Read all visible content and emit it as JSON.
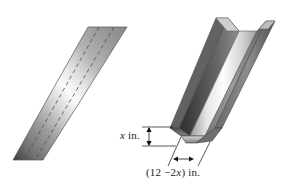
{
  "figure": {
    "objects": {
      "flat_sheet": {
        "name": "flat-metal-sheet",
        "fold_lines": 2,
        "fold_line_style": "dashed"
      },
      "folded_gutter": {
        "name": "folded-u-channel-gutter",
        "faces": [
          "left-wall",
          "bottom",
          "right-wall"
        ]
      }
    },
    "labels": {
      "height_label": "x in.",
      "height_label_variable": "x",
      "height_label_unit": "in.",
      "width_label_open": "(12 ",
      "width_label_minus": "−2",
      "width_label_variable": "x",
      "width_label_close": ") in.",
      "width_label_full": "(12 −2x) in."
    },
    "colors": {
      "background": "#ffffff",
      "metal_dark": "#3a3a3a",
      "metal_mid": "#8d8d8d",
      "metal_light": "#f2f2f2",
      "outline": "#4a4a4a",
      "dash_line": "#5a5a5a",
      "label_text": "#1a1a1a",
      "dimension_line": "#111111"
    }
  }
}
